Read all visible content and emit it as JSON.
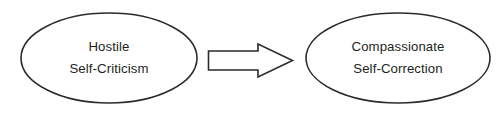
{
  "diagram": {
    "background_color": "#ffffff",
    "stroke_color": "#2b2b2b",
    "text_color": "#231f20",
    "nodes": [
      {
        "id": "hostile-self-criticism",
        "shape": "ellipse",
        "line1": "Hostile",
        "line2": "Self-Criticism",
        "cx": 109,
        "cy": 58,
        "rx": 88,
        "ry": 45
      },
      {
        "id": "compassionate-self-correction",
        "shape": "ellipse",
        "line1": "Compassionate",
        "line2": "Self-Correction",
        "cx": 398,
        "cy": 58,
        "rx": 92,
        "ry": 45
      }
    ],
    "connectors": [
      {
        "id": "transition-arrow",
        "shape": "block-arrow",
        "direction": "right",
        "from": "hostile-self-criticism",
        "to": "compassionate-self-correction",
        "tail_x": 208,
        "tip_x": 293,
        "center_y": 60.5
      }
    ]
  }
}
